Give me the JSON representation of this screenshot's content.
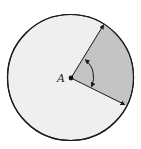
{
  "diagram": {
    "type": "circle-sector",
    "center_label": "A",
    "colors": {
      "circle_fill": "#efefef",
      "sector_fill": "#c4c4c4",
      "stroke": "#1a1a1a",
      "background": "#ffffff"
    }
  }
}
